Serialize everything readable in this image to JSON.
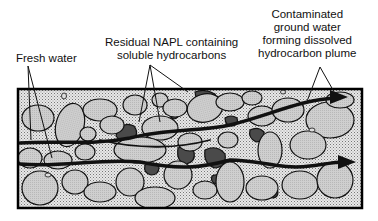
{
  "diagram": {
    "title": "",
    "labels": {
      "fresh_water": {
        "lines": [
          "Fresh water"
        ]
      },
      "residual_napl": {
        "lines": [
          "Residual NAPL containing",
          "soluble hydrocarbons"
        ]
      },
      "plume": {
        "lines": [
          "Contaminated",
          "ground water",
          "forming dissolved",
          "hydrocarbon plume"
        ]
      }
    },
    "legend_elements": {
      "grains": "Light gray soil/rock grains",
      "pore_space": "Stippled pore water",
      "napl": "Dark gray residual NAPL blobs",
      "flow": "Black arrows showing groundwater flow direction (left to right)"
    },
    "colors": {
      "grain": "#c8c8c8",
      "pore": "#e4e4e4",
      "napl": "#4a4a4a",
      "flow": "#111111",
      "outline": "#000000"
    }
  }
}
